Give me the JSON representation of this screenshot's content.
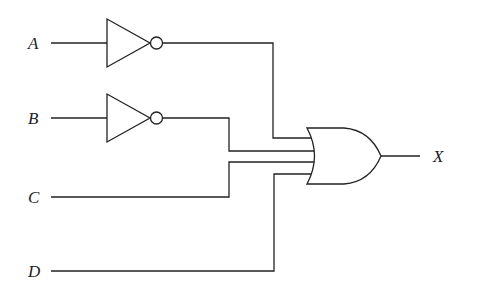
{
  "diagram": {
    "type": "logic-circuit",
    "inputs": [
      {
        "label": "A",
        "inverted": true
      },
      {
        "label": "B",
        "inverted": true
      },
      {
        "label": "C",
        "inverted": false
      },
      {
        "label": "D",
        "inverted": false
      }
    ],
    "gates": [
      {
        "id": "not-a",
        "type": "NOT",
        "input": "A"
      },
      {
        "id": "not-b",
        "type": "NOT",
        "input": "B"
      },
      {
        "id": "or-1",
        "type": "OR",
        "inputs": [
          "not-a",
          "not-b",
          "C",
          "D"
        ]
      }
    ],
    "output": {
      "label": "X",
      "expression": "X = A' + B' + C + D"
    }
  }
}
